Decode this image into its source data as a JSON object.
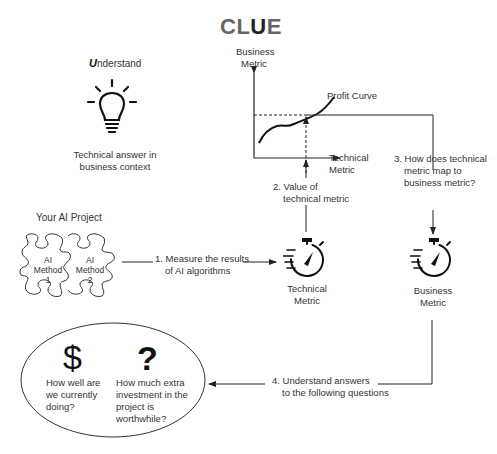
{
  "title": {
    "prefix": "CL",
    "highlight": "U",
    "suffix": "E"
  },
  "understand": {
    "letter": "U",
    "rest": "nderstand",
    "icon": "lightbulb-icon",
    "caption_line1": "Technical answer in",
    "caption_line2": "business context"
  },
  "chart": {
    "y_label_line1": "Business",
    "y_label_line2": "Metric",
    "x_label_line1": "Technical",
    "x_label_line2": "Metric",
    "curve_label": "Profit Curve"
  },
  "project": {
    "label": "Your AI Project",
    "pieces": [
      {
        "line1": "AI",
        "line2": "Method",
        "line3": "1"
      },
      {
        "line1": "AI",
        "line2": "Method",
        "line3": "2"
      }
    ]
  },
  "steps": {
    "step1_line1": "1. Measure the results",
    "step1_line2": "of AI algorithms",
    "step2_line1": "2. Value of",
    "step2_line2": "technical metric",
    "step3_line1": "3. How does technical",
    "step3_line2": "metric map to",
    "step3_line3": "business metric?",
    "step4_line1": "4. Understand answers",
    "step4_line2": "to the following questions"
  },
  "metrics": {
    "technical_line1": "Technical",
    "technical_line2": "Metric",
    "business_line1": "Business",
    "business_line2": "Metric",
    "icon": "stopwatch-icon"
  },
  "questions": {
    "q1_glyph": "$",
    "q1_line1": "How well are",
    "q1_line2": "we currently",
    "q1_line3": "doing?",
    "q2_glyph": "?",
    "q2_line1": "How much extra",
    "q2_line2": "investment in the",
    "q2_line3": "project is",
    "q2_line4": "worthwhile?"
  }
}
